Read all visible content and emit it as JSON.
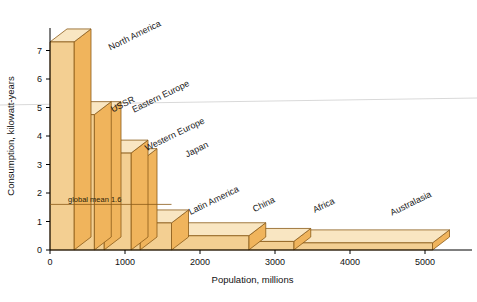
{
  "figure": {
    "type": "3d-bar-chart",
    "background": "#ffffff"
  },
  "axes": {
    "x": {
      "title": "Population, millions",
      "ticks": [
        "0",
        "1000",
        "2000",
        "3000",
        "4000",
        "5000"
      ],
      "tick_values": [
        0,
        1000,
        2000,
        3000,
        4000,
        5000
      ],
      "min": 0,
      "max": 5400
    },
    "y": {
      "title": "Consumption, kilowatt-years",
      "ticks": [
        "0",
        "1",
        "2",
        "3",
        "4",
        "5",
        "6",
        "7"
      ],
      "tick_values": [
        0,
        1,
        2,
        3,
        4,
        5,
        6,
        7
      ],
      "min": 0,
      "max": 8
    }
  },
  "annotation": {
    "global_mean_label": "global mean 1.6",
    "global_mean_value": 1.6
  },
  "colors": {
    "front_face": "#f3cf92",
    "top_face": "#f9e6c2",
    "side_face": "#f0b45c",
    "edge": "#8a5a18",
    "text": "#1a1a1a",
    "scan_line": "#d9d9d9"
  },
  "chart_data": {
    "type": "bar",
    "title": "",
    "subtitle": "",
    "xlabel": "Population, millions",
    "ylabel": "Consumption, kilowatt-years",
    "xlim": [
      0,
      5400
    ],
    "ylim": [
      0,
      8
    ],
    "grid": false,
    "legend": "none",
    "note": "Width of each bar is the region population (millions); height is per-capita consumption in kilowatt-years. Area is total energy consumption.",
    "categories": [
      "North America",
      "USSR",
      "Eastern Europe",
      "Western Europe",
      "Japan",
      "Latin America",
      "China",
      "Africa",
      "Australasia"
    ],
    "values": [
      7.3,
      4.75,
      4.75,
      3.4,
      3.1,
      0.95,
      0.5,
      0.3,
      0.25
    ],
    "widths": [
      320,
      270,
      130,
      360,
      120,
      420,
      1030,
      600,
      1850
    ],
    "x_starts": [
      0,
      320,
      590,
      720,
      1080,
      1200,
      1620,
      2650,
      3250
    ],
    "x_ends": [
      320,
      590,
      720,
      1080,
      1200,
      1620,
      2650,
      3250,
      5100
    ],
    "annotations": [
      "global mean 1.6"
    ],
    "bars": [
      {
        "label": "North America",
        "x_start": 0,
        "x_end": 320,
        "value": 7.3,
        "label_x": 136,
        "label_y": 38
      },
      {
        "label": "USSR",
        "x_start": 320,
        "x_end": 590,
        "value": 4.75,
        "label_x": 124,
        "label_y": 107
      },
      {
        "label": "Eastern Europe",
        "x_start": 590,
        "x_end": 720,
        "value": 4.75,
        "label_x": 162,
        "label_y": 99
      },
      {
        "label": "Western Europe",
        "x_start": 720,
        "x_end": 1080,
        "value": 3.4,
        "label_x": 176,
        "label_y": 137
      },
      {
        "label": "Japan",
        "x_start": 1080,
        "x_end": 1200,
        "value": 3.1,
        "label_x": 198,
        "label_y": 152
      },
      {
        "label": "Latin America",
        "x_start": 1200,
        "x_end": 1620,
        "value": 0.95,
        "label_x": 215,
        "label_y": 203
      },
      {
        "label": "China",
        "x_start": 1620,
        "x_end": 2650,
        "value": 0.5,
        "label_x": 265,
        "label_y": 207
      },
      {
        "label": "Africa",
        "x_start": 2650,
        "x_end": 3250,
        "value": 0.3,
        "label_x": 325,
        "label_y": 208
      },
      {
        "label": "Australasia",
        "x_start": 3250,
        "x_end": 5100,
        "value": 0.25,
        "label_x": 412,
        "label_y": 206
      }
    ]
  }
}
